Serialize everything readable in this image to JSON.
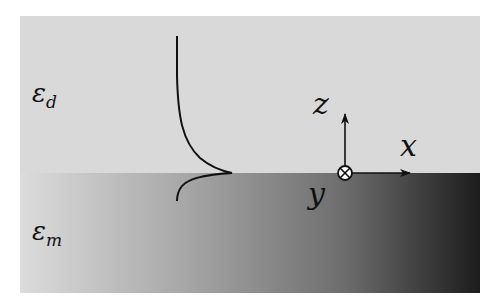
{
  "diagram": {
    "title": "",
    "regions": [
      {
        "name": "dielectric",
        "symbol": "ε",
        "subscript": "d",
        "color": "#d9d9d9"
      },
      {
        "name": "metal",
        "symbol": "ε",
        "subscript": "m",
        "gradient": [
          "#dcdcdc",
          "#1c1c1c"
        ]
      }
    ],
    "axes": {
      "z_label": "z",
      "x_label": "x",
      "y_label": "y",
      "y_direction": "into-page (⊗)"
    },
    "field_profile": {
      "description": "Evanescent field decaying exponentially away from interface; longer decay in dielectric, shorter in metal",
      "peak_at": "interface"
    }
  }
}
